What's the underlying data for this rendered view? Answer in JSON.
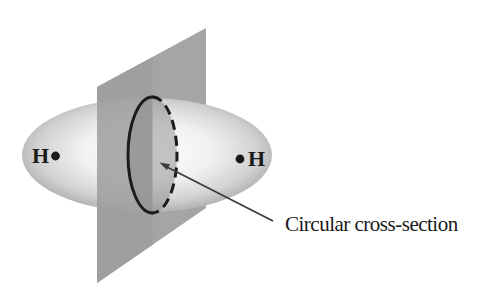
{
  "diagram": {
    "kind": "H2 sigma-bond electron cloud with cutting plane",
    "atoms": {
      "left": "H",
      "right": "H"
    },
    "annotation": {
      "label": "Circular cross-section"
    },
    "colors": {
      "background": "#ffffff",
      "plane": "#a5a5a5",
      "plane_front": "#9e9e9e",
      "cross_section_fill": "#8a8a8a",
      "outline": "#1c1c1c",
      "arrow": "#3a3a3a",
      "text": "#1a1a1a",
      "ellipsoid_center": "#ffffff",
      "ellipsoid_mid": "#f1f1f1",
      "ellipsoid_outer": "#d2d2d2",
      "ellipsoid_edge": "#b6b6b6"
    }
  }
}
